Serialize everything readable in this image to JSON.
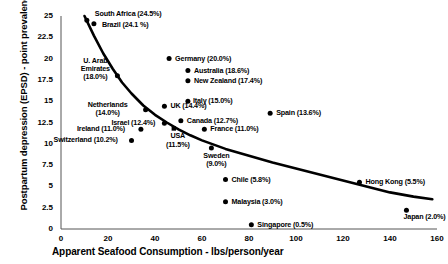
{
  "chart_data": {
    "type": "scatter",
    "title": "",
    "xlabel": "Apparent Seafood Consumption - lbs/person/year",
    "ylabel": "Postpartum depression (EPSD) - point prevalence %",
    "xlim": [
      0,
      160
    ],
    "ylim": [
      0,
      25
    ],
    "xticks": [
      "0",
      "20",
      "40",
      "60",
      "80",
      "100",
      "120",
      "140",
      "160"
    ],
    "yticks": [
      "0",
      "2.5",
      "5",
      "7.5",
      "10",
      "12.5",
      "15",
      "17.5",
      "20",
      "22.5",
      "25"
    ],
    "grid": false,
    "legend": "none",
    "marker_color": "#000000",
    "trendline_color": "#000000",
    "points": [
      {
        "name": "South Africa",
        "value": "24.5%",
        "label": "South Africa (24.5%)",
        "x": 11,
        "y": 24.5
      },
      {
        "name": "Brazil",
        "value": "24.1%",
        "label": "Brazil (24.1 %)",
        "x": 14,
        "y": 24.1
      },
      {
        "name": "U. Arab Emirates",
        "value": "18.0%",
        "label": "U. Arab Emirates (18.0%)",
        "x": 24,
        "y": 18.0
      },
      {
        "name": "Germany",
        "value": "20.0%",
        "label": "Germany (20.0%)",
        "x": 46,
        "y": 20.0
      },
      {
        "name": "Australia",
        "value": "18.6%",
        "label": "Australia (18.6%)",
        "x": 54,
        "y": 18.6
      },
      {
        "name": "New Zealand",
        "value": "17.4%",
        "label": "New Zealand (17.4%)",
        "x": 54,
        "y": 17.4
      },
      {
        "name": "Italy",
        "value": "15.0%",
        "label": "Italy (15.0%)",
        "x": 54,
        "y": 15.0
      },
      {
        "name": "Netherlands",
        "value": "14.0%",
        "label": "Netherlands (14.0%)",
        "x": 36,
        "y": 14.0
      },
      {
        "name": "UK",
        "value": "14.4%",
        "label": "UK (14.4%)",
        "x": 44,
        "y": 14.4
      },
      {
        "name": "Spain",
        "value": "13.6%",
        "label": "Spain (13.6%)",
        "x": 89,
        "y": 13.6
      },
      {
        "name": "Israel",
        "value": "12.4%",
        "label": "Israel (12.4%)",
        "x": 44,
        "y": 12.4
      },
      {
        "name": "Canada",
        "value": "12.7%",
        "label": "Canada (12.7%)",
        "x": 51,
        "y": 12.7
      },
      {
        "name": "Ireland",
        "value": "11.0%",
        "label": "Ireland (11.0%)",
        "x": 34,
        "y": 11.7
      },
      {
        "name": "USA",
        "value": "11.5%",
        "label": "USA (11.5%)",
        "x": 48,
        "y": 11.8
      },
      {
        "name": "France",
        "value": "11.0%",
        "label": "France (11.0%)",
        "x": 61,
        "y": 11.7
      },
      {
        "name": "Switzerland",
        "value": "10.2%",
        "label": "Switzerland (10.2%)",
        "x": 30,
        "y": 10.4
      },
      {
        "name": "Sweden",
        "value": "9.0%",
        "label": "Sweden (9.0%)",
        "x": 64,
        "y": 9.5
      },
      {
        "name": "Chile",
        "value": "5.8%",
        "label": "Chile (5.8%)",
        "x": 70,
        "y": 5.8
      },
      {
        "name": "Malaysia",
        "value": "3.0%",
        "label": "Malaysia (3.0%)",
        "x": 70,
        "y": 3.2
      },
      {
        "name": "Singapore",
        "value": "0.5%",
        "label": "Singapore (0.5%)",
        "x": 81,
        "y": 0.5
      },
      {
        "name": "Hong Kong",
        "value": "5.5%",
        "label": "Hong Kong (5.5%)",
        "x": 127,
        "y": 5.5
      },
      {
        "name": "Japan",
        "value": "2.0%",
        "label": "Japan (2.0%)",
        "x": 147,
        "y": 2.2
      }
    ],
    "trendline": {
      "description": "decreasing fitted curve from high prevalence at low seafood consumption to low prevalence at high consumption",
      "points": [
        {
          "x": 10,
          "y": 25.0
        },
        {
          "x": 14,
          "y": 22.7
        },
        {
          "x": 18,
          "y": 20.6
        },
        {
          "x": 22,
          "y": 18.8
        },
        {
          "x": 26,
          "y": 17.2
        },
        {
          "x": 30,
          "y": 15.9
        },
        {
          "x": 35,
          "y": 14.5
        },
        {
          "x": 40,
          "y": 13.4
        },
        {
          "x": 45,
          "y": 12.5
        },
        {
          "x": 50,
          "y": 11.7
        },
        {
          "x": 55,
          "y": 11.0
        },
        {
          "x": 60,
          "y": 10.4
        },
        {
          "x": 70,
          "y": 9.4
        },
        {
          "x": 80,
          "y": 8.6
        },
        {
          "x": 90,
          "y": 7.8
        },
        {
          "x": 100,
          "y": 7.1
        },
        {
          "x": 110,
          "y": 6.4
        },
        {
          "x": 120,
          "y": 5.7
        },
        {
          "x": 130,
          "y": 5.0
        },
        {
          "x": 140,
          "y": 4.3
        },
        {
          "x": 150,
          "y": 3.8
        },
        {
          "x": 158,
          "y": 3.5
        }
      ]
    }
  }
}
